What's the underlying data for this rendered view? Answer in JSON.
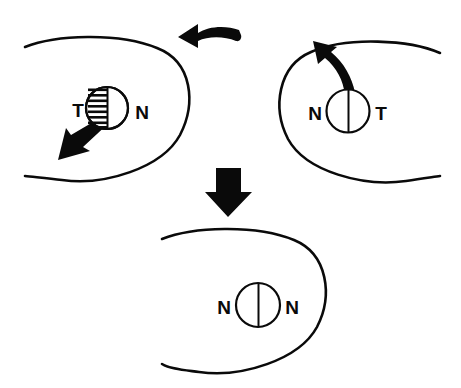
{
  "figure": {
    "background_color": "#ffffff",
    "ink_color": "#0a0a0a",
    "width": 461,
    "height": 388
  },
  "panels": [
    {
      "id": "top-left-cell",
      "name": "top-left-cell",
      "cell_shape": "open-ellipse",
      "opening_side": "left",
      "nucleus": {
        "left_half_fill": "hatched",
        "right_half_fill": "white",
        "divider": "vertical"
      },
      "labels": {
        "left": "T",
        "right": "N"
      },
      "arrow": {
        "name": "migration-arrow-down-left",
        "direction": "down-left",
        "style": "tapered-solid"
      }
    },
    {
      "id": "top-right-cell",
      "name": "top-right-cell",
      "cell_shape": "open-ellipse",
      "opening_side": "right",
      "nucleus": {
        "left_half_fill": "white",
        "right_half_fill": "white",
        "divider": "vertical"
      },
      "labels": {
        "left": "N",
        "right": "T"
      },
      "arrow": {
        "name": "migration-arrow-up-left",
        "direction": "up-left",
        "style": "curved-solid"
      }
    },
    {
      "id": "bottom-cell",
      "name": "bottom-cell",
      "cell_shape": "open-ellipse",
      "opening_side": "left",
      "nucleus": {
        "left_half_fill": "white",
        "right_half_fill": "white",
        "divider": "vertical"
      },
      "labels": {
        "left": "N",
        "right": "N"
      },
      "arrow": null
    }
  ],
  "connectors": [
    {
      "id": "top-curved-arrow",
      "name": "curved-arrow-leftward",
      "direction": "left",
      "style": "curved-block"
    },
    {
      "id": "down-block-arrow",
      "name": "block-arrow-downward",
      "direction": "down",
      "style": "block"
    }
  ],
  "labels": {
    "top_left_pole_left": "T",
    "top_left_pole_right": "N",
    "top_right_pole_left": "N",
    "top_right_pole_right": "T",
    "bottom_pole_left": "N",
    "bottom_pole_right": "N"
  }
}
